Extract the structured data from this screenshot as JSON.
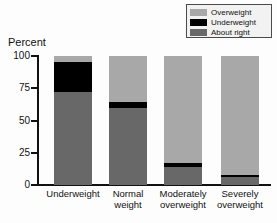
{
  "percent_axis_caption": "Percent",
  "legend": {
    "items": [
      {
        "label": "Overweight",
        "color": "#a8a8a8",
        "name": "legend-swatch-overweight"
      },
      {
        "label": "Underweight",
        "color": "#000000",
        "name": "legend-swatch-underweight"
      },
      {
        "label": "About right",
        "color": "#686868",
        "name": "legend-swatch-about-right"
      }
    ]
  },
  "chart_data": {
    "type": "bar",
    "stacked": true,
    "title": "",
    "xlabel": "",
    "ylabel": "Percent",
    "ylim": [
      0,
      100
    ],
    "yticks": [
      0,
      25,
      50,
      75,
      100
    ],
    "ytick_labels": [
      "0",
      "25",
      "50",
      "75",
      "100"
    ],
    "grid": false,
    "legend_position": "top-right",
    "categories": [
      "Underweight",
      "Normal weight",
      "Moderately overweight",
      "Severely overweight"
    ],
    "category_lines": [
      [
        "Underweight"
      ],
      [
        "Normal",
        "weight"
      ],
      [
        "Moderately",
        "overweight"
      ],
      [
        "Severely",
        "overweight"
      ]
    ],
    "series": [
      {
        "name": "About right",
        "color": "#686868",
        "values": [
          72,
          60,
          14,
          6
        ]
      },
      {
        "name": "Underweight",
        "color": "#000000",
        "values": [
          23,
          4,
          3,
          2
        ]
      },
      {
        "name": "Overweight",
        "color": "#a8a8a8",
        "values": [
          5,
          36,
          83,
          92
        ]
      }
    ]
  }
}
